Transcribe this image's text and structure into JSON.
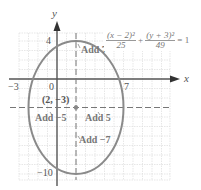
{
  "diagram": {
    "equation": {
      "term1_numerator": "(x − 2)²",
      "term1_denominator": "25",
      "plus": "+",
      "term2_numerator": "(y + 3)²",
      "term2_denominator": "49",
      "rhs": "= 1"
    },
    "axes": {
      "x_label": "x",
      "y_label": "y",
      "x_ticks_labeled": [
        "−3",
        "0",
        "7"
      ],
      "y_ticks_labeled": [
        "4",
        "−10"
      ]
    },
    "center": {
      "label": "(2, −3)",
      "x": 2,
      "y": -3
    },
    "annotations": {
      "add_up": "Add 7",
      "add_left": "Add −5",
      "add_right": "Add 5",
      "add_down": "Add −7"
    },
    "ellipse": {
      "h": 2,
      "k": -3,
      "a": 5,
      "b": 7
    },
    "colors": {
      "ellipse": "#8a8a8a",
      "axes": "#555555",
      "grid": "#d8d8d8",
      "dashed": "#777777",
      "text": "#555555"
    }
  }
}
